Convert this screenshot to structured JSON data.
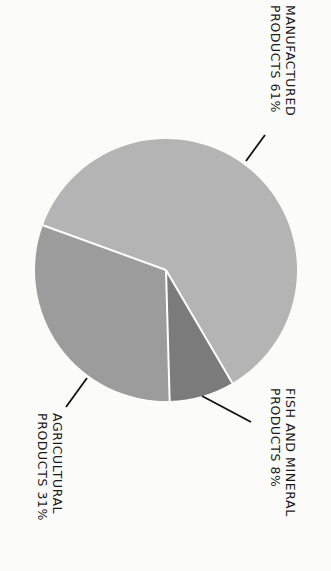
{
  "chart_data": {
    "type": "pie",
    "title": "",
    "orientation": "rotated 90deg clockwise",
    "slices": [
      {
        "label": "MANUFACTURED PRODUCTS",
        "line1": "MANUFACTURED",
        "line2": "PRODUCTS 61%",
        "value": 61,
        "color": "#b4b4b4"
      },
      {
        "label": "FISH AND MINERAL PRODUCTS",
        "line1": "FISH AND MINERAL",
        "line2": "PRODUCTS 8%",
        "value": 8,
        "color": "#7b7b7b"
      },
      {
        "label": "AGRICULTURAL PRODUCTS",
        "line1": "AGRICULTURAL",
        "line2": "PRODUCTS 31%",
        "value": 31,
        "color": "#9c9c9c"
      }
    ],
    "start_angle_deg": 290,
    "separator_color": "#ffffff",
    "leader_color": "#111111"
  }
}
